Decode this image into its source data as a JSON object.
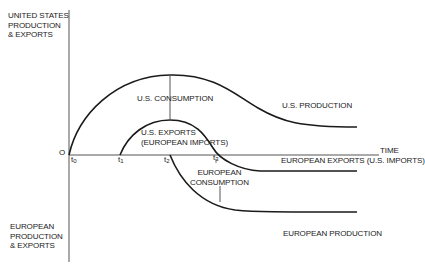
{
  "diagram": {
    "axes": {
      "origin_label": "O",
      "x_axis_label": "TIME",
      "y_axis_top_label": [
        "UNITED STATES",
        "PRODUCTION",
        "& EXPORTS"
      ],
      "y_axis_bottom_label": [
        "EUROPEAN",
        "PRODUCTION",
        "& EXPORTS"
      ]
    },
    "time_marks": [
      {
        "base": "t",
        "sub": "0"
      },
      {
        "base": "t",
        "sub": "1"
      },
      {
        "base": "t",
        "sub": "2"
      },
      {
        "base": "t",
        "sub": "3"
      }
    ],
    "curves": {
      "us_production": "U.S. PRODUCTION",
      "us_consumption": "U.S. CONSUMPTION",
      "us_exports": [
        "U.S. EXPORTS",
        "(EUROPEAN IMPORTS)"
      ],
      "european_exports": "EUROPEAN EXPORTS (U.S. IMPORTS)",
      "european_consumption": [
        "EUROPEAN",
        "CONSUMPTION"
      ],
      "european_production": "EUROPEAN PRODUCTION"
    },
    "colors": {
      "line": "#1a1a1a",
      "axis": "#555555",
      "background": "#ffffff"
    }
  }
}
